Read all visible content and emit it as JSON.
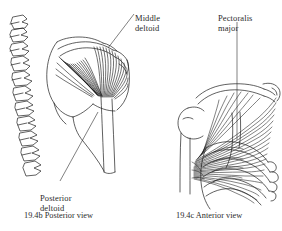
{
  "page": {
    "background_color": "#ffffff",
    "ink_color": "#1c1c1c",
    "text_color": "#2b2b2b",
    "kind": "anatomy-textbook-figure"
  },
  "labels": {
    "middle_deltoid": {
      "line1": "Middle",
      "line2": "deltoid"
    },
    "pectoralis_major": {
      "line1": "Pectoralis",
      "line2": "major"
    },
    "posterior_deltoid": {
      "line1": "Posterior",
      "line2": "deltoid"
    }
  },
  "captions": {
    "posterior": "19.4b Posterior view",
    "anterior": "19.4c Anterior view"
  },
  "figures": [
    {
      "id": "posterior-view",
      "caption": "19.4b Posterior view",
      "structures": [
        "vertebral column",
        "scapula",
        "spine of scapula",
        "posterior deltoid",
        "middle deltoid",
        "humerus"
      ]
    },
    {
      "id": "anterior-view",
      "caption": "19.4c Anterior view",
      "structures": [
        "clavicle",
        "sternum",
        "ribs",
        "costal cartilage",
        "pectoralis major",
        "humerus"
      ]
    }
  ]
}
